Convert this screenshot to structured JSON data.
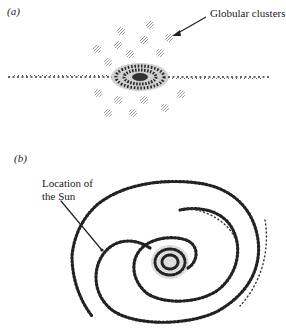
{
  "panels": {
    "a": {
      "label": "(a)",
      "annotation": "Globular clusters"
    },
    "b": {
      "label": "(b)",
      "annotation_line1": "Location of",
      "annotation_line2": "the Sun"
    }
  },
  "colors": {
    "ink": "#222222",
    "cluster": "#9a9a9a",
    "background": "#ffffff"
  }
}
